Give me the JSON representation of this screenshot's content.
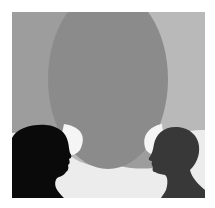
{
  "illustration": {
    "description": "Two head silhouettes facing each other with overlapping speech bubbles",
    "colors": {
      "background_bottom": "#ececec",
      "left_bubble": "#9d9d9d",
      "right_bubble": "#b9b9b9",
      "overlap": "#8b8b8b",
      "left_head": "#0a0a0a",
      "right_head": "#383838",
      "bubble_highlight": "#f5f5f5"
    },
    "figures": [
      {
        "name": "left-person",
        "facing": "right"
      },
      {
        "name": "right-person",
        "facing": "left"
      }
    ]
  }
}
